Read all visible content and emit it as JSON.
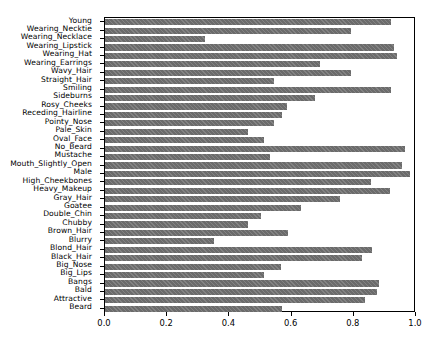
{
  "chart_data": {
    "type": "bar",
    "orientation": "horizontal",
    "title": "",
    "xlabel": "",
    "ylabel": "",
    "xlim": [
      0.0,
      1.0
    ],
    "xticks": [
      "0.0",
      "0.2",
      "0.4",
      "0.6",
      "0.8",
      "1.0"
    ],
    "xtick_values": [
      0.0,
      0.2,
      0.4,
      0.6,
      0.8,
      1.0
    ],
    "grid": false,
    "legend": null,
    "bar_color": "#6b6b6b",
    "bar_hatch": "diagonal",
    "categories": [
      "Young",
      "Wearing_Necktie",
      "Wearing_Necklace",
      "Wearing_Lipstick",
      "Wearing_Hat",
      "Wearing_Earrings",
      "Wavy_Hair",
      "Straight_Hair",
      "Smiling",
      "Sideburns",
      "Rosy_Cheeks",
      "Receding_Hairline",
      "Pointy_Nose",
      "Pale_Skin",
      "Oval_Face",
      "No_Beard",
      "Mustache",
      "Mouth_Slightly_Open",
      "Male",
      "High_Cheekbones",
      "Heavy_Makeup",
      "Gray_Hair",
      "Goatee",
      "Double_Chin",
      "Chubby",
      "Brown_Hair",
      "Blurry",
      "Blond_Hair",
      "Black_Hair",
      "Big_Nose",
      "Big_Lips",
      "Bangs",
      "Bald",
      "Attractive",
      "Beard"
    ],
    "values": [
      0.92,
      0.79,
      0.32,
      0.93,
      0.94,
      0.69,
      0.79,
      0.545,
      0.92,
      0.675,
      0.585,
      0.57,
      0.545,
      0.46,
      0.51,
      0.965,
      0.53,
      0.955,
      0.98,
      0.855,
      0.915,
      0.755,
      0.63,
      0.5,
      0.46,
      0.59,
      0.35,
      0.86,
      0.825,
      0.565,
      0.51,
      0.88,
      0.875,
      0.835,
      0.57
    ]
  }
}
